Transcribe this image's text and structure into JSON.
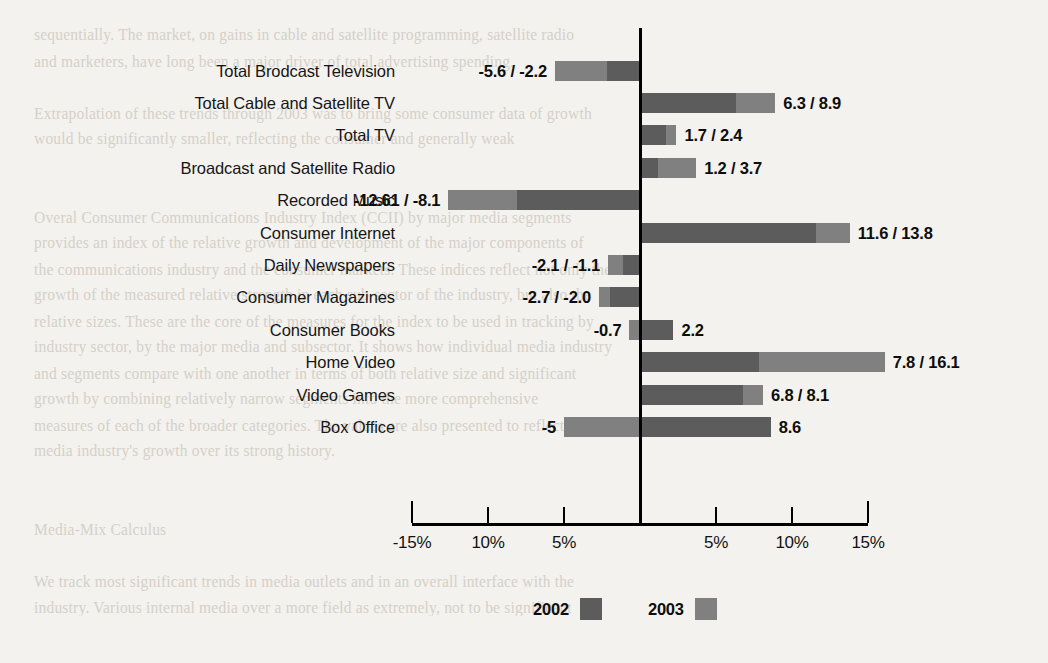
{
  "background_text": "sequentially. The market, on gains in cable and satellite programming, satellite radio\nand marketers, have long been a major driver of total advertising spending.\n\nExtrapolation of these trends through 2003 was to bring some consumer data of growth\nwould be significantly smaller, reflecting the consumer and generally weak\n\n\nOveral Consumer Communications Industry Index (CCII) by major media segments\nprovides an index of the relative growth and development of the major components of\nthe communications industry and the consumer markets. These indices reflect not only the\ngrowth of the measured relative strength in each sub-sector of the industry, but also the\nrelative sizes. These are the core of the measures for the index to be used in tracking by\nindustry sector, by the major media and subsector. It shows how individual media industry\nand segments compare with one another in terms of both relative size and significant\ngrowth by combining relatively narrow segments into the more comprehensive\nmeasures of each of the broader categories. The values are also presented to reflect the\nmedia industry's growth over its strong history.\n\n\nMedia-Mix Calculus\n\nWe track most significant trends in media outlets and in an overall interface with the\nindustry. Various internal media over a more field as extremely, not to be significant",
  "chart_data": {
    "type": "bar",
    "orientation": "horizontal",
    "title": "",
    "xlabel": "",
    "ylabel": "",
    "xlim": [
      -15,
      15
    ],
    "grid": false,
    "legend_position": "bottom",
    "legend": [
      {
        "name": "2002",
        "color": "#5c5c5c"
      },
      {
        "name": "2003",
        "color": "#808080"
      }
    ],
    "colors": {
      "y2002": "#5c5c5c",
      "y2003": "#808080",
      "axis": "#000000",
      "text": "#111111"
    },
    "xticks": [
      -15,
      -10,
      -5,
      0,
      5,
      10,
      15
    ],
    "xticklabels": [
      "-15%",
      "10%",
      "5%",
      "",
      "5%",
      "10%",
      "15%"
    ],
    "categories": [
      "Total Brodcast Television",
      "Total Cable and Satellite TV",
      "Total TV",
      "Broadcast and Satellite Radio",
      "Recorded Music",
      "Consumer Internet",
      "Daily Newspapers",
      "Consumer Magazines",
      "Consumer Books",
      "Home Video",
      "Video Games",
      "Box Office"
    ],
    "series": [
      {
        "name": "2002",
        "values": [
          -2.2,
          6.3,
          1.7,
          1.2,
          -8.1,
          11.6,
          -1.1,
          -2.0,
          2.2,
          7.8,
          6.8,
          8.6
        ]
      },
      {
        "name": "2003",
        "values": [
          -5.6,
          8.9,
          2.4,
          3.7,
          -12.61,
          13.8,
          -2.1,
          -2.7,
          -0.7,
          16.1,
          8.1,
          -5.0
        ]
      }
    ],
    "value_labels": [
      {
        "category": "Total Brodcast Television",
        "text": "-5.6 / -2.2",
        "side": "left"
      },
      {
        "category": "Total Cable and Satellite TV",
        "text": "6.3 / 8.9",
        "side": "right"
      },
      {
        "category": "Total TV",
        "text": "1.7 / 2.4",
        "side": "right"
      },
      {
        "category": "Broadcast and Satellite Radio",
        "text": "1.2 / 3.7",
        "side": "right"
      },
      {
        "category": "Recorded Music",
        "text": "-12.61 / -8.1",
        "side": "left"
      },
      {
        "category": "Consumer Internet",
        "text": "11.6 / 13.8",
        "side": "right"
      },
      {
        "category": "Daily Newspapers",
        "text": "-2.1 / -1.1",
        "side": "left"
      },
      {
        "category": "Consumer Magazines",
        "text": "-2.7 / -2.0",
        "side": "left"
      },
      {
        "category": "Consumer Books",
        "text": "-0.7",
        "side": "left",
        "text_right": "2.2"
      },
      {
        "category": "Home Video",
        "text": "7.8 / 16.1",
        "side": "right"
      },
      {
        "category": "Video Games",
        "text": "6.8 / 8.1",
        "side": "right"
      },
      {
        "category": "Box Office",
        "text": "-5",
        "side": "left",
        "text_right": "8.6"
      }
    ]
  }
}
